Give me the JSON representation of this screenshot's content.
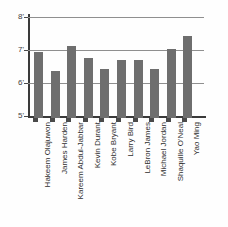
{
  "chart_data": {
    "type": "bar",
    "title": "",
    "xlabel": "",
    "ylabel": "",
    "ylim": [
      5,
      8
    ],
    "ytick_values": [
      5,
      6,
      7,
      8
    ],
    "ytick_labels": [
      "5'",
      "6'",
      "7'",
      "8'"
    ],
    "grid": true,
    "gridlines_at": [
      6,
      7,
      8
    ],
    "legend": false,
    "orientation": "vertical",
    "bar_color": "#6e6e6e",
    "axis_color": "#3a3a3a",
    "gridline_color": "#8f8f8f",
    "background_color": "#fefefe",
    "value_unit": "feet",
    "categories": [
      "Hakeem Olajuwon",
      "James Harden",
      "Kareem Abdul-Jabbar",
      "Kevin Durant",
      "Kobe Bryant",
      "Larry Bird",
      "LeBron James",
      "Michael Jordan",
      "Shaquille O'Neal",
      "Yao Ming"
    ],
    "values": [
      7.0,
      6.42,
      7.17,
      6.83,
      6.5,
      6.75,
      6.75,
      6.5,
      7.08,
      7.5
    ],
    "value_labels": [
      "7'0\"",
      "6'5\"",
      "7'2\"",
      "6'10\"",
      "6'6\"",
      "6'9\"",
      "6'9\"",
      "6'6\"",
      "7'1\"",
      "7'6\""
    ]
  }
}
